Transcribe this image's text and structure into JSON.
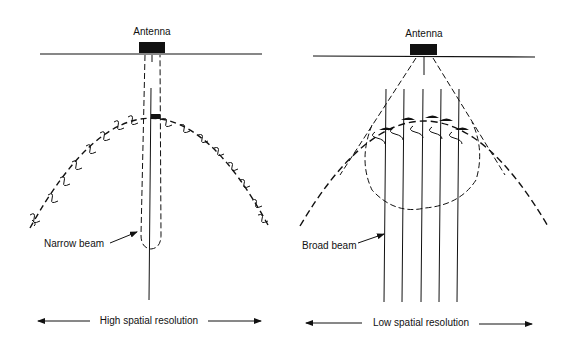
{
  "diagram": {
    "left_panel": {
      "antenna_label": "Antenna",
      "beam_label": "Narrow beam",
      "resolution_label": "High spatial resolution"
    },
    "right_panel": {
      "antenna_label": "Antenna",
      "beam_label": "Broad beam",
      "resolution_label": "Low spatial resolution"
    },
    "colors": {
      "ink": "#111111",
      "background": "#ffffff"
    }
  }
}
